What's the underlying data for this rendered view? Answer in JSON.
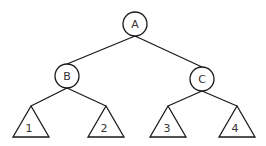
{
  "diagram": {
    "type": "binary-tree",
    "nodes": [
      {
        "id": "A",
        "label": "A",
        "shape": "circle",
        "cx": 135,
        "cy": 24,
        "r": 12
      },
      {
        "id": "B",
        "label": "B",
        "shape": "circle",
        "cx": 67,
        "cy": 76,
        "r": 12
      },
      {
        "id": "C",
        "label": "C",
        "shape": "circle",
        "cx": 202,
        "cy": 79,
        "r": 12
      }
    ],
    "subtrees": [
      {
        "id": "T1",
        "label": "1",
        "shape": "triangle",
        "apex": [
          31,
          106
        ],
        "base_y": 137,
        "base_x": [
          13,
          49
        ]
      },
      {
        "id": "T2",
        "label": "2",
        "shape": "triangle",
        "apex": [
          106,
          106
        ],
        "base_y": 137,
        "base_x": [
          88,
          124
        ]
      },
      {
        "id": "T3",
        "label": "3",
        "shape": "triangle",
        "apex": [
          168,
          106
        ],
        "base_y": 137,
        "base_x": [
          150,
          186
        ]
      },
      {
        "id": "T4",
        "label": "4",
        "shape": "triangle",
        "apex": [
          237,
          106
        ],
        "base_y": 137,
        "base_x": [
          219,
          255
        ]
      }
    ],
    "edges": [
      {
        "from": "A",
        "to": "B"
      },
      {
        "from": "A",
        "to": "C"
      },
      {
        "from": "B",
        "to": "T1"
      },
      {
        "from": "B",
        "to": "T2"
      },
      {
        "from": "C",
        "to": "T3"
      },
      {
        "from": "C",
        "to": "T4"
      }
    ],
    "colors": {
      "stroke": "#1a1a1a",
      "label": "#333333",
      "background": "#ffffff"
    }
  }
}
